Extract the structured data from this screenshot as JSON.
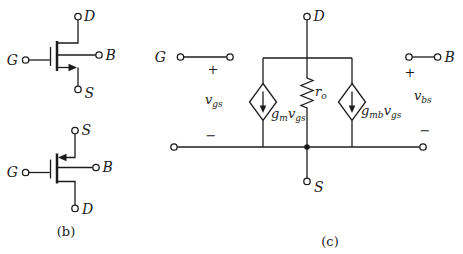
{
  "panel_b": {
    "caption": "(b)",
    "top_symbol": {
      "drain": "D",
      "gate": "G",
      "body": "B",
      "source": "S"
    },
    "bottom_symbol": {
      "source": "S",
      "gate": "G",
      "body": "B",
      "drain": "D"
    }
  },
  "panel_c": {
    "caption": "(c)",
    "terminals": {
      "gate": "G",
      "drain": "D",
      "body": "B",
      "source": "S"
    },
    "vgs": {
      "base": "v",
      "sub": "gs"
    },
    "vbs": {
      "base": "v",
      "sub": "bs"
    },
    "ro": {
      "base": "r",
      "sub": "o"
    },
    "gm_source": {
      "coeff": "g",
      "coeff_sub": "m",
      "var": "v",
      "var_sub": "gs"
    },
    "gmb_source": {
      "coeff": "g",
      "coeff_sub": "mb",
      "var": "v",
      "var_sub": "gs"
    },
    "signs": {
      "plus": "+",
      "minus": "−"
    }
  },
  "colors": {
    "ink": "#1c1c1c",
    "background": "#ffffff"
  }
}
